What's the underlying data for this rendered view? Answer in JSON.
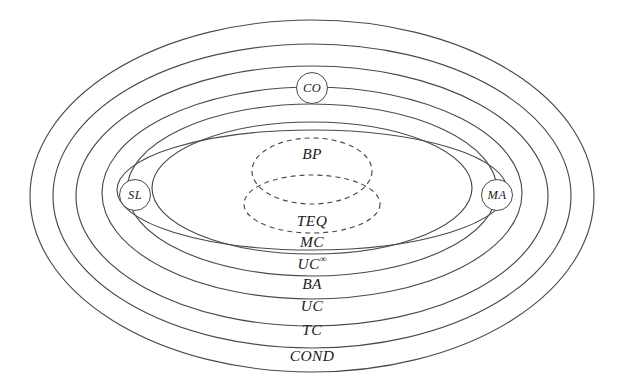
{
  "figure": {
    "type": "euler-diagram",
    "background_color": "#ffffff",
    "stroke_color": "#4a4a4a",
    "text_color": "#1b1b1b",
    "width": 625,
    "height": 390
  },
  "rings": [
    {
      "id": "cond",
      "label": "COND",
      "style": "solid",
      "label_x": 312,
      "label_y": 356,
      "cx": 312,
      "cy": 196,
      "rx": 282,
      "ry": 176
    },
    {
      "id": "tc",
      "label": "TC",
      "style": "solid",
      "label_x": 312,
      "label_y": 330,
      "cx": 312,
      "cy": 196,
      "rx": 259,
      "ry": 152
    },
    {
      "id": "uc",
      "label": "UC",
      "style": "solid",
      "label_x": 312,
      "label_y": 306,
      "cx": 312,
      "cy": 196,
      "rx": 236,
      "ry": 130
    },
    {
      "id": "ba",
      "label": "BA",
      "style": "solid",
      "label_x": 312,
      "label_y": 284,
      "cx": 312,
      "cy": 193,
      "rx": 210,
      "ry": 106
    },
    {
      "id": "ucinf",
      "label": "UC",
      "superscript": "∞",
      "style": "solid",
      "label_x": 312,
      "label_y": 263,
      "cx": 312,
      "cy": 190,
      "rx": 185,
      "ry": 86
    },
    {
      "id": "mc",
      "label": "MC",
      "style": "solid",
      "label_x": 312,
      "label_y": 242,
      "cx": 312,
      "cy": 188,
      "rx": 160,
      "ry": 66
    }
  ],
  "cross_ellipse": {
    "id": "cross",
    "style": "solid",
    "cx": 312,
    "cy": 190,
    "rx": 195,
    "ry": 60,
    "note": "wide flat ellipse crossing the nested rings"
  },
  "dashed": [
    {
      "id": "bp",
      "label": "BP",
      "style": "dashed",
      "label_x": 312,
      "label_y": 154,
      "cx": 312,
      "cy": 171,
      "rx": 60,
      "ry": 33
    },
    {
      "id": "teq",
      "label": "TEQ",
      "style": "dashed",
      "label_x": 312,
      "label_y": 221,
      "cx": 312,
      "cy": 204,
      "rx": 68,
      "ry": 29
    }
  ],
  "nodes": [
    {
      "id": "co",
      "label": "CO",
      "x": 312,
      "y": 88,
      "d": 30
    },
    {
      "id": "sl",
      "label": "SL",
      "x": 135,
      "y": 195,
      "d": 30
    },
    {
      "id": "ma",
      "label": "MA",
      "x": 497,
      "y": 195,
      "d": 30
    }
  ]
}
